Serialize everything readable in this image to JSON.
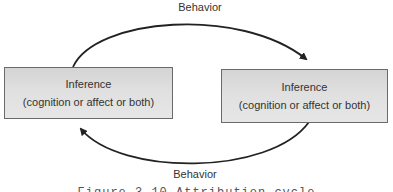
{
  "diagram": {
    "top_arrow_label": "Behavior",
    "bottom_arrow_label": "Behavior",
    "left_box": {
      "title": "Inference",
      "subtitle": "(cognition or affect or both)"
    },
    "right_box": {
      "title": "Inference",
      "subtitle": "(cognition or affect or both)"
    },
    "caption": "Figure 3.10 Attribution cycle",
    "colors": {
      "box_fill": "#dcdcdc",
      "box_border": "#6a6a6a",
      "arrow": "#222222",
      "text": "#333333"
    }
  }
}
